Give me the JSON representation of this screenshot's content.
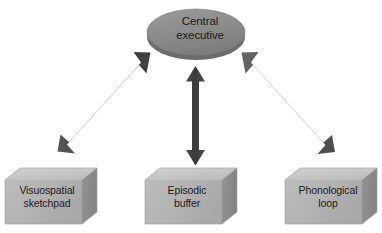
{
  "diagram": {
    "background_color": "#ffffff",
    "central_node": {
      "id": "central-executive",
      "label": "Central\nexecutive",
      "shape": "ellipse-3d-disc",
      "fill_color": "#8e8e8e",
      "rim_color": "#6f6f6f",
      "text_color": "#1b1b1b"
    },
    "boxes": [
      {
        "id": "visuospatial-sketchpad",
        "label": "Visuospatial\nsketchpad",
        "shape": "cube-3d",
        "front_color": "#b4b4b4",
        "top_color": "#c9c9c9",
        "side_color": "#8c8c8c",
        "text_color": "#1b1b1b"
      },
      {
        "id": "episodic-buffer",
        "label": "Episodic\nbuffer",
        "shape": "cube-3d",
        "front_color": "#b4b4b4",
        "top_color": "#c9c9c9",
        "side_color": "#8c8c8c",
        "text_color": "#1b1b1b"
      },
      {
        "id": "phonological-loop",
        "label": "Phonological\nloop",
        "shape": "cube-3d",
        "front_color": "#b4b4b4",
        "top_color": "#c9c9c9",
        "side_color": "#8c8c8c",
        "text_color": "#1b1b1b"
      }
    ],
    "connectors": [
      {
        "id": "connector-central-to-visuospatial",
        "from": "central-executive",
        "to": "visuospatial-sketchpad",
        "direction": "bidirectional",
        "color": "#4a4a4a",
        "orientation": "diagonal-left"
      },
      {
        "id": "connector-central-to-episodic",
        "from": "central-executive",
        "to": "episodic-buffer",
        "direction": "bidirectional",
        "color": "#3d3d3d",
        "orientation": "vertical"
      },
      {
        "id": "connector-central-to-phonological",
        "from": "central-executive",
        "to": "phonological-loop",
        "direction": "bidirectional",
        "color": "#5a5a5a",
        "orientation": "diagonal-right"
      }
    ]
  }
}
